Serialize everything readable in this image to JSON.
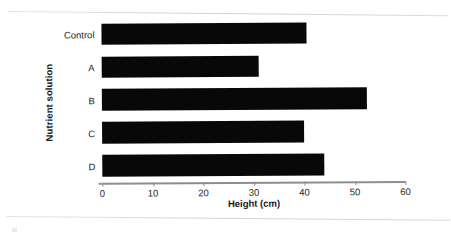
{
  "chart_data": {
    "type": "bar",
    "orientation": "horizontal",
    "title": "",
    "xlabel": "Height (cm)",
    "ylabel": "Nutrient solution",
    "categories": [
      "Control",
      "A",
      "B",
      "C",
      "D"
    ],
    "values": [
      40.5,
      31,
      52.5,
      40,
      44
    ],
    "xlim": [
      0,
      60
    ],
    "xticks": [
      0,
      10,
      20,
      30,
      40,
      50,
      60
    ],
    "xtick_labels": [
      "0",
      "10",
      "20",
      "30",
      "40",
      "50",
      "60"
    ],
    "grid": false,
    "legend": null,
    "bar_color": "#080808",
    "axis_color": "#8d8d8d",
    "series": [
      {
        "name": "Height",
        "values": [
          40.5,
          31,
          52.5,
          40,
          44
        ]
      }
    ]
  },
  "figure": {
    "bars": [
      {
        "category": "Control",
        "value": 40.5
      },
      {
        "category": "A",
        "value": 31
      },
      {
        "category": "B",
        "value": 52.5
      },
      {
        "category": "C",
        "value": 40
      },
      {
        "category": "D",
        "value": 44
      }
    ],
    "x_axis": {
      "title": "Height (cm)",
      "ticks": [
        {
          "label": "0",
          "value": 0
        },
        {
          "label": "10",
          "value": 10
        },
        {
          "label": "20",
          "value": 20
        },
        {
          "label": "30",
          "value": 30
        },
        {
          "label": "40",
          "value": 40
        },
        {
          "label": "50",
          "value": 50
        },
        {
          "label": "60",
          "value": 60
        }
      ]
    },
    "y_axis": {
      "title": "Nutrient solution"
    }
  }
}
